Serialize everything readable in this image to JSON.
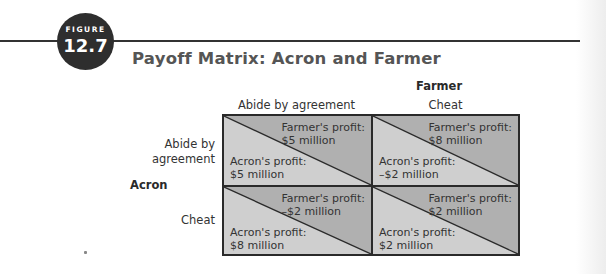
{
  "figure": {
    "label": "FIGURE",
    "number": "12.7",
    "title": "Payoff Matrix: Acron and Farmer"
  },
  "colors": {
    "badge": "#2e2e2e",
    "upper_triangle": "#b0b0b0",
    "lower_triangle": "#cfcfcf",
    "grid_line": "#2a2a2a"
  },
  "matrix": {
    "column_player": "Farmer",
    "row_player": "Acron",
    "columns": [
      "Abide by agreement",
      "Cheat"
    ],
    "rows": [
      {
        "label_line1": "Abide by",
        "label_line2": "agreement"
      },
      {
        "label_line1": "Cheat",
        "label_line2": ""
      }
    ],
    "cells": [
      [
        {
          "farmer_label": "Farmer's profit:",
          "farmer_value": "$5 million",
          "acron_label": "Acron's profit:",
          "acron_value": "$5 million"
        },
        {
          "farmer_label": "Farmer's profit:",
          "farmer_value": "$8 million",
          "acron_label": "Acron's profit:",
          "acron_value": "–$2 million"
        }
      ],
      [
        {
          "farmer_label": "Farmer's profit:",
          "farmer_value": "–$2 million",
          "acron_label": "Acron's profit:",
          "acron_value": "$8 million"
        },
        {
          "farmer_label": "Farmer's profit:",
          "farmer_value": "$2 million",
          "acron_label": "Acron's profit:",
          "acron_value": "$2 million"
        }
      ]
    ]
  }
}
